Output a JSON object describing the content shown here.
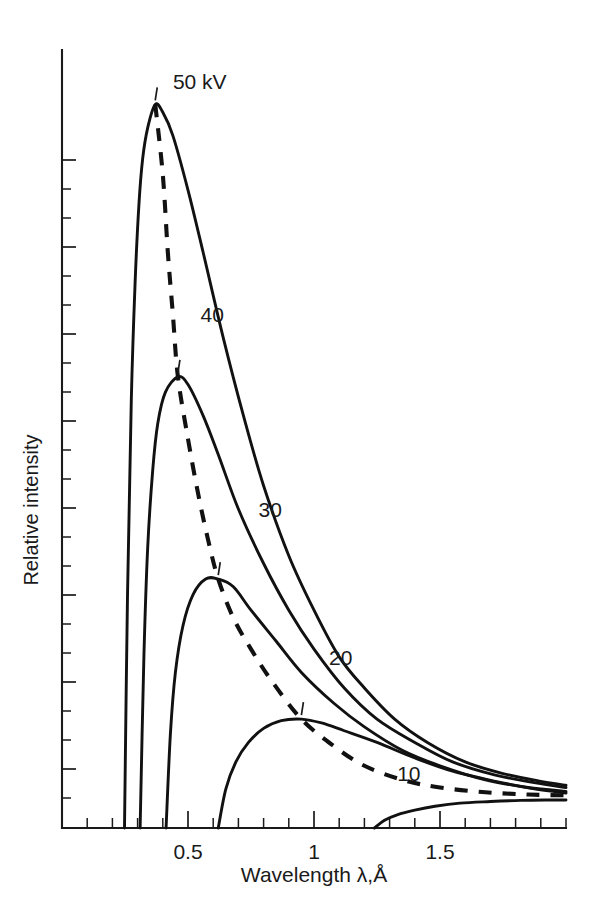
{
  "chart_data": {
    "type": "line",
    "title": "",
    "xlabel": "Wavelength λ,Å",
    "ylabel": "Relative intensity",
    "xlim": [
      0.0,
      2.0
    ],
    "ylim": [
      0,
      100
    ],
    "grid": false,
    "legend_position": "inline-curve-labels",
    "xticks": [
      0.5,
      1,
      1.5
    ],
    "xtick_labels": [
      "0.5",
      "1",
      "1.5"
    ],
    "xtick_minor_step": 0.1,
    "ytick_labels": [],
    "annotations": [
      {
        "text": "50 kV",
        "x": 0.44,
        "y": 95
      },
      {
        "text": "40",
        "x": 0.55,
        "y": 65
      },
      {
        "text": "30",
        "x": 0.78,
        "y": 40
      },
      {
        "text": "20",
        "x": 1.06,
        "y": 21
      },
      {
        "text": "10",
        "x": 1.33,
        "y": 6
      }
    ],
    "series": [
      {
        "name": "50 kV",
        "label": "50 kV",
        "style": "solid",
        "swl": 0.248,
        "peak_x": 0.37,
        "peak_y": 93,
        "points": [
          [
            0.248,
            0
          ],
          [
            0.26,
            30
          ],
          [
            0.275,
            55
          ],
          [
            0.29,
            70
          ],
          [
            0.305,
            80
          ],
          [
            0.32,
            86
          ],
          [
            0.34,
            90
          ],
          [
            0.37,
            93
          ],
          [
            0.4,
            92
          ],
          [
            0.44,
            89
          ],
          [
            0.5,
            82
          ],
          [
            0.56,
            74
          ],
          [
            0.64,
            63
          ],
          [
            0.72,
            53
          ],
          [
            0.8,
            44
          ],
          [
            0.9,
            35
          ],
          [
            1.0,
            28
          ],
          [
            1.1,
            22
          ],
          [
            1.2,
            18
          ],
          [
            1.32,
            14
          ],
          [
            1.45,
            11
          ],
          [
            1.6,
            8.5
          ],
          [
            1.75,
            7
          ],
          [
            1.9,
            6
          ],
          [
            2.0,
            5.5
          ]
        ]
      },
      {
        "name": "40 kV",
        "label": "40",
        "style": "solid",
        "swl": 0.31,
        "peak_x": 0.46,
        "peak_y": 58,
        "points": [
          [
            0.31,
            0
          ],
          [
            0.325,
            22
          ],
          [
            0.34,
            36
          ],
          [
            0.36,
            46
          ],
          [
            0.38,
            52
          ],
          [
            0.41,
            56
          ],
          [
            0.46,
            58
          ],
          [
            0.5,
            57
          ],
          [
            0.56,
            53
          ],
          [
            0.62,
            48
          ],
          [
            0.7,
            41
          ],
          [
            0.8,
            34
          ],
          [
            0.9,
            28
          ],
          [
            1.0,
            23
          ],
          [
            1.12,
            18
          ],
          [
            1.25,
            14
          ],
          [
            1.4,
            11
          ],
          [
            1.55,
            8.5
          ],
          [
            1.72,
            6.8
          ],
          [
            1.88,
            5.8
          ],
          [
            2.0,
            5.2
          ]
        ]
      },
      {
        "name": "30 kV",
        "label": "30",
        "style": "solid",
        "swl": 0.413,
        "peak_x": 0.62,
        "peak_y": 32,
        "points": [
          [
            0.413,
            0
          ],
          [
            0.43,
            12
          ],
          [
            0.45,
            20
          ],
          [
            0.48,
            26
          ],
          [
            0.52,
            30
          ],
          [
            0.57,
            32
          ],
          [
            0.62,
            32
          ],
          [
            0.68,
            31
          ],
          [
            0.75,
            28
          ],
          [
            0.85,
            24
          ],
          [
            0.95,
            20
          ],
          [
            1.08,
            16
          ],
          [
            1.2,
            13
          ],
          [
            1.35,
            10
          ],
          [
            1.5,
            8
          ],
          [
            1.68,
            6.2
          ],
          [
            1.85,
            5.2
          ],
          [
            2.0,
            4.7
          ]
        ]
      },
      {
        "name": "20 kV",
        "label": "20",
        "style": "solid",
        "swl": 0.62,
        "peak_x": 0.95,
        "peak_y": 14,
        "points": [
          [
            0.62,
            0
          ],
          [
            0.65,
            5
          ],
          [
            0.69,
            8.5
          ],
          [
            0.74,
            11
          ],
          [
            0.8,
            12.8
          ],
          [
            0.87,
            13.8
          ],
          [
            0.95,
            14
          ],
          [
            1.03,
            13.5
          ],
          [
            1.12,
            12.5
          ],
          [
            1.25,
            11
          ],
          [
            1.4,
            9
          ],
          [
            1.55,
            7.3
          ],
          [
            1.72,
            6
          ],
          [
            1.88,
            5
          ],
          [
            2.0,
            4.5
          ]
        ]
      },
      {
        "name": "10 kV",
        "label": "10",
        "style": "solid",
        "swl": 1.24,
        "peak_x": 1.95,
        "peak_y": 3.6,
        "points": [
          [
            1.24,
            0
          ],
          [
            1.28,
            1.0
          ],
          [
            1.33,
            1.7
          ],
          [
            1.4,
            2.3
          ],
          [
            1.48,
            2.8
          ],
          [
            1.58,
            3.2
          ],
          [
            1.7,
            3.4
          ],
          [
            1.82,
            3.55
          ],
          [
            1.92,
            3.6
          ],
          [
            2.0,
            3.6
          ]
        ]
      },
      {
        "name": "peak locus",
        "label": "",
        "style": "dashed",
        "points": [
          [
            0.37,
            93
          ],
          [
            0.4,
            84
          ],
          [
            0.42,
            74
          ],
          [
            0.44,
            66
          ],
          [
            0.46,
            58
          ],
          [
            0.5,
            50
          ],
          [
            0.54,
            43
          ],
          [
            0.58,
            37
          ],
          [
            0.62,
            32
          ],
          [
            0.68,
            27
          ],
          [
            0.75,
            23
          ],
          [
            0.83,
            19
          ],
          [
            0.95,
            14
          ],
          [
            1.08,
            10.5
          ],
          [
            1.2,
            8
          ],
          [
            1.35,
            6.2
          ],
          [
            1.5,
            5.2
          ],
          [
            1.68,
            4.6
          ],
          [
            1.85,
            4.3
          ],
          [
            2.0,
            4.2
          ]
        ]
      }
    ]
  }
}
